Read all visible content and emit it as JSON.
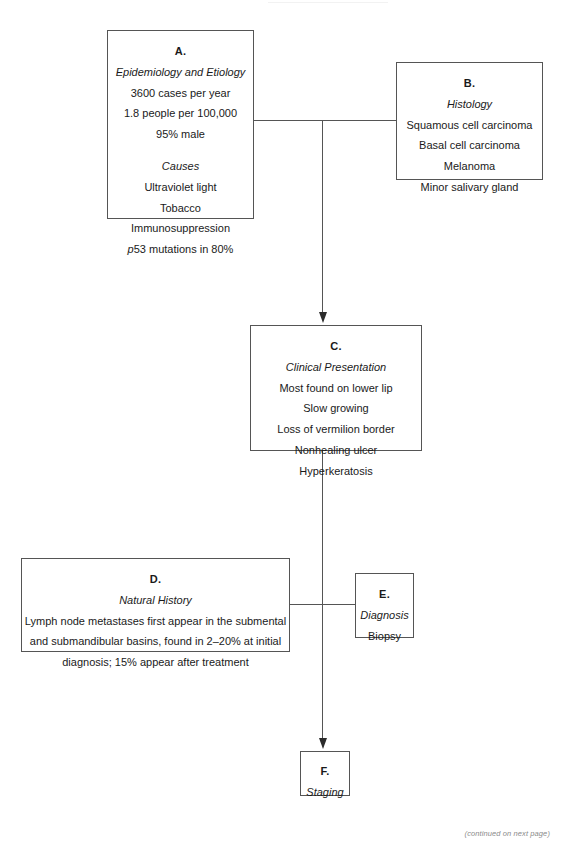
{
  "page": {
    "footer_note": "(continued on next page)"
  },
  "boxes": {
    "a": {
      "letter": "A.",
      "subtitle": "Epidemiology and Etiology",
      "lines": [
        "3600 cases per year",
        "1.8 people per 100,000",
        "95% male"
      ],
      "subtitle2": "Causes",
      "lines2": [
        "Ultraviolet light",
        "Tobacco",
        "Immunosuppression",
        "p53 mutations in 80%"
      ]
    },
    "b": {
      "letter": "B.",
      "subtitle": "Histology",
      "lines": [
        "Squamous cell carcinoma",
        "Basal cell carcinoma",
        "Melanoma",
        "Minor salivary gland"
      ]
    },
    "c": {
      "letter": "C.",
      "subtitle": "Clinical Presentation",
      "lines": [
        "Most found on lower lip",
        "Slow growing",
        "Loss of vermilion border",
        "Nonhealing ulcer",
        "Hyperkeratosis"
      ]
    },
    "d": {
      "letter": "D.",
      "subtitle": "Natural History",
      "lines": [
        "Lymph node metastases first appear in the submental",
        "and submandibular basins, found in 2–20% at initial",
        "diagnosis; 15% appear after treatment"
      ]
    },
    "e": {
      "letter": "E.",
      "subtitle": "Diagnosis",
      "lines": [
        "Biopsy"
      ]
    },
    "f": {
      "letter": "F.",
      "subtitle": "Staging",
      "lines": []
    }
  },
  "chart_data": {
    "type": "diagram",
    "nodes": [
      {
        "id": "A",
        "label": "Epidemiology and Etiology"
      },
      {
        "id": "B",
        "label": "Histology"
      },
      {
        "id": "C",
        "label": "Clinical Presentation"
      },
      {
        "id": "D",
        "label": "Natural History"
      },
      {
        "id": "E",
        "label": "Diagnosis"
      },
      {
        "id": "F",
        "label": "Staging"
      }
    ],
    "edges": [
      {
        "from": "A",
        "to": "B",
        "style": "plain-line"
      },
      {
        "from": "A",
        "to": "C",
        "style": "arrow"
      },
      {
        "from": "C",
        "to": "E",
        "style": "plain-line"
      },
      {
        "from": "D",
        "to": "E",
        "style": "plain-line"
      },
      {
        "from": "C",
        "to": "F",
        "style": "arrow"
      }
    ]
  }
}
